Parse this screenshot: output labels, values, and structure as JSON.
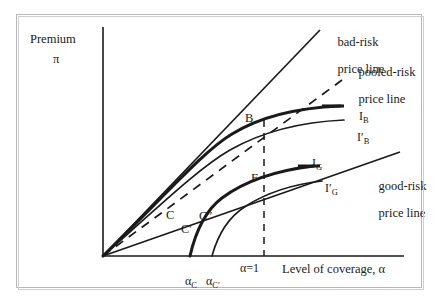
{
  "figure": {
    "kind": "economics-insurance-diagram"
  },
  "axes": {
    "y_title": "Premium",
    "y_symbol": "π",
    "x_title": "Level of coverage, α"
  },
  "annotations": {
    "bad_risk_line": "bad-risk\nprice line",
    "pooled_risk_line": "pooled-risk\nprice line",
    "good_risk_line": "good-risk\nprice line"
  },
  "curve_labels": {
    "IB": "I",
    "IB_sub": "B",
    "IBprime": "I′",
    "IBprime_sub": "B",
    "IG": "I",
    "IG_sub": "G",
    "IGprime": "I′",
    "IGprime_sub": "G"
  },
  "points": {
    "B": "B",
    "F": "F",
    "C": "C",
    "Cprime": "C′",
    "Cdprime": "C″"
  },
  "ticks": {
    "alpha_C": "α",
    "alpha_C_sub": "C",
    "alpha_Cprime": "α",
    "alpha_Cprime_sub": "C′",
    "alpha_one": "α=1"
  },
  "colors": {
    "ink": "#1a1a1a",
    "frame": "#b8b8b8",
    "background": "#ffffff"
  },
  "chart_data": {
    "type": "line",
    "title": "",
    "xlabel": "Level of coverage, α",
    "ylabel": "Premium π",
    "grid": false,
    "legend": "inline-annotations",
    "origin": {
      "x": 0,
      "y": 0
    },
    "xlim": [
      0,
      1.35
    ],
    "ylim": [
      0,
      1.0
    ],
    "tick_positions": {
      "alpha_C": 0.42,
      "alpha_Cprime": 0.5,
      "alpha_one": 0.72
    },
    "series": [
      {
        "name": "bad-risk price line",
        "kind": "straight-line",
        "from": [
          0,
          0
        ],
        "to": [
          0.78,
          0.95
        ],
        "slope_note": "steepest ray from origin"
      },
      {
        "name": "pooled-risk price line",
        "kind": "dashed-straight-line",
        "from": [
          0,
          0
        ],
        "to": [
          0.93,
          0.73
        ],
        "dashed": true
      },
      {
        "name": "good-risk price line",
        "kind": "straight-line",
        "from": [
          0,
          0
        ],
        "to": [
          1.22,
          0.42
        ],
        "slope_note": "flattest ray from origin"
      },
      {
        "name": "I_B",
        "kind": "indifference-curve",
        "concavity": "concave-down",
        "passes_through": [
          "B"
        ],
        "end": [
          1.07,
          0.64
        ]
      },
      {
        "name": "I'_B",
        "kind": "indifference-curve",
        "concavity": "concave-down",
        "passes_through": [
          "F"
        ],
        "end": [
          1.09,
          0.56
        ]
      },
      {
        "name": "I_G",
        "kind": "indifference-curve",
        "concavity": "concave-down",
        "passes_through": [
          "C"
        ],
        "end": [
          0.95,
          0.36
        ]
      },
      {
        "name": "I'_G",
        "kind": "indifference-curve",
        "concavity": "concave-down",
        "passes_through": [
          "C″"
        ],
        "end": [
          0.97,
          0.3
        ]
      }
    ],
    "marked_points": [
      {
        "label": "B",
        "x": 0.72,
        "y": 0.6
      },
      {
        "label": "F",
        "x": 0.72,
        "y": 0.42
      },
      {
        "label": "C",
        "x": 0.42,
        "y": 0.2
      },
      {
        "label": "C′",
        "x": 0.46,
        "y": 0.16
      },
      {
        "label": "C″",
        "x": 0.55,
        "y": 0.2
      }
    ],
    "vertical_dashed_line_at": 0.72
  }
}
